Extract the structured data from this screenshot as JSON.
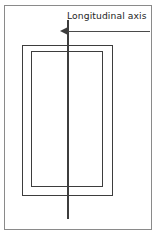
{
  "figure": {
    "background_color": "#ffffff",
    "line_color": "#3d3d3d",
    "frame_color": "#8a8a8a",
    "text_color": "#262626",
    "annotation": {
      "label": "Longitudinal axis",
      "arrow_direction": "left",
      "arrow_icon": "arrow-left-icon"
    },
    "shapes": {
      "outer_frame": "page-border",
      "outer_rectangle": "body-outline",
      "inner_rectangle": "inner-outline",
      "axis_line": "vertical-axis"
    }
  }
}
